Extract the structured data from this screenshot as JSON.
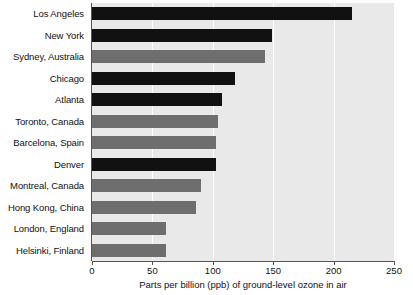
{
  "chart_data": {
    "type": "bar",
    "orientation": "horizontal",
    "title": "",
    "xlabel": "Parts per billion (ppb) of ground-level ozone in air",
    "ylabel": "",
    "xlim": [
      0,
      250
    ],
    "xticks": [
      0,
      50,
      100,
      150,
      200,
      250
    ],
    "xtick_labels": [
      "0",
      "50",
      "100",
      "150",
      "200",
      "250"
    ],
    "grid": "vertical-white",
    "legend": "none",
    "categories": [
      "Los Angeles",
      "New York",
      "Sydney, Australia",
      "Chicago",
      "Atlanta",
      "Toronto, Canada",
      "Barcelona, Spain",
      "Denver",
      "Montreal, Canada",
      "Hong Kong, China",
      "London, England",
      "Helsinki, Finland"
    ],
    "values": [
      215,
      149,
      143,
      118,
      108,
      104,
      103,
      103,
      90,
      86,
      61,
      61
    ],
    "bar_colors": [
      "#111111",
      "#111111",
      "#6e6e6e",
      "#111111",
      "#111111",
      "#6e6e6e",
      "#6e6e6e",
      "#111111",
      "#6e6e6e",
      "#6e6e6e",
      "#6e6e6e",
      "#6e6e6e"
    ],
    "plot_background": "#e9e9e9",
    "gridline_color": "#fdfdfd",
    "axis_color": "#555555"
  },
  "margin_text": ""
}
